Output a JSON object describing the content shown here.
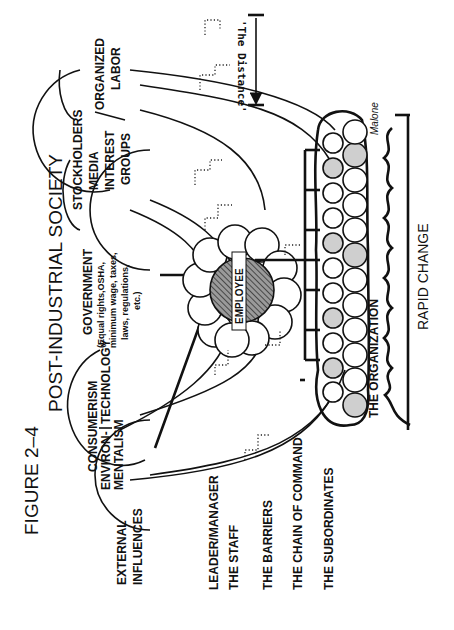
{
  "figure": {
    "label": "FIGURE 2–4",
    "title": "POST-INDUSTRIAL SOCIETY",
    "signature": "Malone"
  },
  "external_influences": {
    "heading_line1": "EXTERNAL",
    "heading_line2": "INFLUENCES",
    "groups": [
      {
        "line1": "CONSUMERISM",
        "line2": "ENVIRON-",
        "line3": "MENTALISM"
      },
      {
        "line1": "TECHNOLOGY"
      },
      {
        "line1": "GOVERNMENT",
        "line2": "(Equal rights,OSHA,",
        "line3": "minimum wage, taxes,",
        "line4": "laws, regulations,",
        "line5": "etc.)"
      },
      {
        "line1": "STOCKHOLDERS",
        "line2": "MEDIA",
        "line3": "INTEREST",
        "line4": "GROUPS"
      },
      {
        "line1": "ORGANIZED",
        "line2": "LABOR"
      }
    ]
  },
  "center": {
    "employee_label": "EMPLOYEE"
  },
  "organization": {
    "label": "THE ORGANIZATION",
    "environment_label": "RAPID CHANGE"
  },
  "distance": {
    "label": "'The Distance'"
  },
  "legend": {
    "items": [
      "LEADER/MANAGER",
      "THE STAFF",
      "THE BARRIERS",
      "THE CHAIN OF COMMAND",
      "THE SUBORDINATES"
    ]
  },
  "colors": {
    "ink": "#111111",
    "shaded": "#cfcfcf",
    "paper": "#ffffff"
  }
}
